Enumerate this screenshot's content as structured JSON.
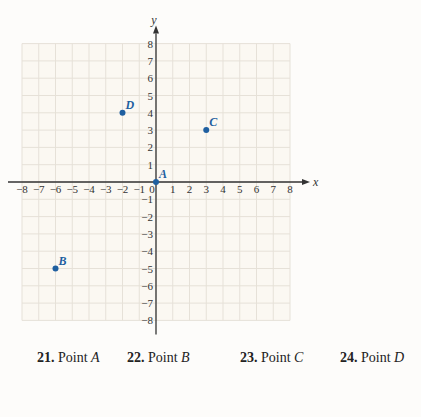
{
  "chart_data": {
    "type": "scatter",
    "title": "",
    "xlabel": "x",
    "ylabel": "y",
    "xlim": [
      -8,
      8
    ],
    "ylim": [
      -8,
      8
    ],
    "grid": true,
    "x_ticks": [
      -8,
      -7,
      -6,
      -5,
      -4,
      -3,
      -2,
      -1,
      0,
      1,
      2,
      3,
      4,
      5,
      6,
      7,
      8
    ],
    "y_ticks": [
      -8,
      -7,
      -6,
      -5,
      -4,
      -3,
      -2,
      -1,
      1,
      2,
      3,
      4,
      5,
      6,
      7,
      8
    ],
    "points": [
      {
        "label": "A",
        "x": 0,
        "y": 0
      },
      {
        "label": "B",
        "x": -6,
        "y": -5
      },
      {
        "label": "C",
        "x": 3,
        "y": 3
      },
      {
        "label": "D",
        "x": -2,
        "y": 4
      }
    ],
    "point_color": "#1f5fa0",
    "grid_color": "#e6e1d8",
    "axis_color": "#333333"
  },
  "exercises": [
    {
      "number": "21.",
      "text": "Point ",
      "point": "A"
    },
    {
      "number": "22.",
      "text": "Point ",
      "point": "B"
    },
    {
      "number": "23.",
      "text": "Point ",
      "point": "C"
    },
    {
      "number": "24.",
      "text": "Point ",
      "point": "D"
    }
  ]
}
